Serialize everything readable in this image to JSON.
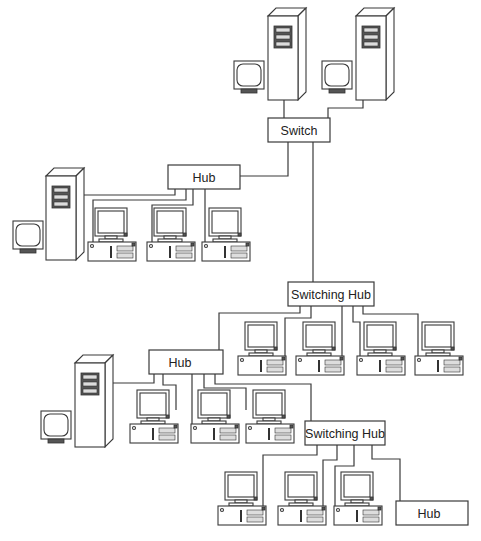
{
  "diagram": {
    "type": "network-topology",
    "nodes": {
      "switch": {
        "label": "Switch",
        "x": 268,
        "y": 118,
        "w": 62,
        "h": 24
      },
      "hub_top": {
        "label": "Hub",
        "x": 168,
        "y": 165,
        "w": 72,
        "h": 24
      },
      "switching_hub_mid": {
        "label": "Switching Hub",
        "x": 288,
        "y": 282,
        "w": 86,
        "h": 24
      },
      "hub_mid": {
        "label": "Hub",
        "x": 149,
        "y": 350,
        "w": 74,
        "h": 24
      },
      "switching_hub_low": {
        "label": "Switching Hub",
        "x": 305,
        "y": 421,
        "w": 80,
        "h": 24
      },
      "hub_bottom": {
        "label": "Hub",
        "x": 396,
        "y": 501,
        "w": 72,
        "h": 24
      }
    },
    "servers": [
      {
        "id": "server-1",
        "x": 268,
        "y": 15
      },
      {
        "id": "server-2",
        "x": 356,
        "y": 15
      },
      {
        "id": "server-3",
        "x": 46,
        "y": 178
      },
      {
        "id": "server-4",
        "x": 75,
        "y": 366
      }
    ],
    "monitors": [
      {
        "id": "monitor-1",
        "x": 234,
        "y": 62
      },
      {
        "id": "monitor-2",
        "x": 322,
        "y": 62
      },
      {
        "id": "monitor-3",
        "x": 14,
        "y": 222
      },
      {
        "id": "monitor-4",
        "x": 42,
        "y": 412
      }
    ],
    "workstations": [
      {
        "id": "pc-1",
        "x": 88,
        "y": 207
      },
      {
        "id": "pc-2",
        "x": 146,
        "y": 207
      },
      {
        "id": "pc-3",
        "x": 201,
        "y": 207
      },
      {
        "id": "pc-4",
        "x": 238,
        "y": 322
      },
      {
        "id": "pc-5",
        "x": 296,
        "y": 322
      },
      {
        "id": "pc-6",
        "x": 358,
        "y": 322
      },
      {
        "id": "pc-7",
        "x": 415,
        "y": 322
      },
      {
        "id": "pc-8",
        "x": 130,
        "y": 390
      },
      {
        "id": "pc-9",
        "x": 190,
        "y": 390
      },
      {
        "id": "pc-10",
        "x": 245,
        "y": 390
      },
      {
        "id": "pc-11",
        "x": 218,
        "y": 472
      },
      {
        "id": "pc-12",
        "x": 278,
        "y": 472
      },
      {
        "id": "pc-13",
        "x": 334,
        "y": 472
      }
    ]
  }
}
